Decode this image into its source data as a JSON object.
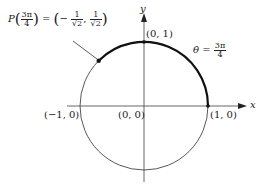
{
  "diagram": {
    "axes": {
      "x_label": "x",
      "y_label": "y"
    },
    "points": [
      {
        "id": "origin",
        "label": "(0, 0)"
      },
      {
        "id": "top",
        "label": "(0, 1)"
      },
      {
        "id": "right",
        "label": "(1, 0)"
      },
      {
        "id": "left",
        "label": "(−1, 0)"
      }
    ],
    "p_label": {
      "func": "P",
      "arg_num": "3π",
      "arg_den": "4",
      "equals": "=",
      "x_sign": "−",
      "x_num": "1",
      "x_den": "√2",
      "comma": ",",
      "y_num": "1",
      "y_den": "√2"
    },
    "theta_label": {
      "symbol": "θ",
      "equals": "=",
      "num": "3π",
      "den": "4"
    },
    "colors": {
      "axis": "#555555",
      "circle": "#444444",
      "arc": "#111111"
    }
  }
}
